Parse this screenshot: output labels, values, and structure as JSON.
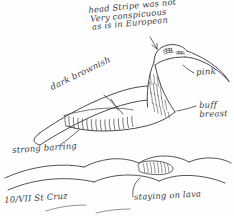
{
  "sketch": {
    "title": "Field sketch of a whimbrel-type shorebird",
    "medium": "pencil on paper",
    "background_color": "#fefefe",
    "ink_color": "#4a4a4e"
  },
  "annotations": {
    "head_stripe": {
      "line1": "head Stripe was not",
      "line2": "Very conspicuous",
      "line3": "as is in European"
    },
    "dark_brownish": "dark brownish",
    "pink": "pink",
    "buff_breast": {
      "line1": "buff",
      "line2": "breast"
    },
    "strong_barring": "strong barring",
    "staying_on_lava": "staying on lava",
    "date_location": "10/VII St Cruz"
  },
  "subject": {
    "features": [
      "long decurved bill",
      "head stripe",
      "pink bill base",
      "buff breast",
      "strong barring on flank",
      "lava rock"
    ]
  }
}
